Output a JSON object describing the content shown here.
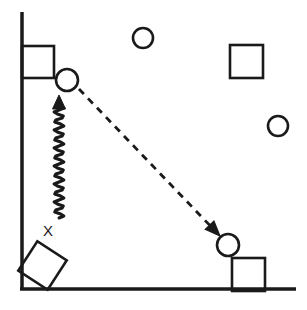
{
  "diagram": {
    "stroke_color": "#1a1a1a",
    "background_color": "#ffffff",
    "labels": [
      {
        "id": "x-label",
        "text": "X",
        "x": 48,
        "y": 236
      }
    ],
    "wall": {
      "name": "vertical-wall",
      "x1": 22,
      "y1": 12,
      "x2": 22,
      "y2": 290,
      "stroke_width": 3.5
    },
    "ground": {
      "name": "horizontal-ground",
      "x1": 20,
      "y1": 289,
      "x2": 296,
      "y2": 289,
      "stroke_width": 3.5
    },
    "squares": [
      {
        "id": "wall-block",
        "x": 22,
        "y": 46,
        "size": 32,
        "rotation": 0,
        "stroke_width": 2.6
      },
      {
        "id": "upper-right-block",
        "x": 230,
        "y": 45,
        "size": 33,
        "rotation": 0,
        "stroke_width": 2.6
      },
      {
        "id": "ground-block",
        "x": 232,
        "y": 258,
        "size": 33,
        "rotation": 0,
        "stroke_width": 2.6
      },
      {
        "id": "tilted-corner-block",
        "x": 25,
        "y": 248,
        "size": 35,
        "rotation": 33,
        "stroke_width": 2.6
      }
    ],
    "circles": [
      {
        "id": "launch-ball",
        "cx": 67,
        "cy": 80,
        "r": 11,
        "stroke_width": 2.6
      },
      {
        "id": "landing-ball",
        "cx": 228,
        "cy": 245,
        "r": 11,
        "stroke_width": 2.6
      },
      {
        "id": "top-ball",
        "cx": 143,
        "cy": 38,
        "r": 10,
        "stroke_width": 2.6
      },
      {
        "id": "right-ball",
        "cx": 278,
        "cy": 126,
        "r": 10,
        "stroke_width": 2.6
      }
    ],
    "spring_arrow": {
      "id": "spring-wavy-arrow",
      "x": 59,
      "y_top": 95,
      "y_bottom": 218,
      "amplitude": 5,
      "wavelength": 9,
      "stroke_width": 3,
      "arrow_direction": "up"
    },
    "dashed_arrow": {
      "id": "trajectory-dashed-arrow",
      "x1": 79,
      "y1": 89,
      "x2": 220,
      "y2": 236,
      "dash": "7 6",
      "stroke_width": 2.8,
      "arrow_direction": "down-right"
    }
  }
}
